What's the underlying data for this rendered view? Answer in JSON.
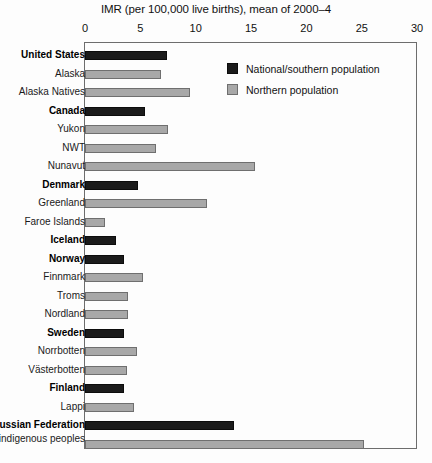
{
  "chart_data": {
    "type": "bar",
    "orientation": "horizontal",
    "title": "IMR (per 100,000 live births), mean of 2000–4",
    "xlabel": "",
    "ylabel": "",
    "xlim": [
      0,
      30
    ],
    "xticks": [
      "0",
      "5",
      "10",
      "15",
      "20",
      "25",
      "30"
    ],
    "grid": false,
    "legend_position": "top-right",
    "legend": [
      {
        "key": "national",
        "label": "National/southern population",
        "color": "#1b1b1b"
      },
      {
        "key": "northern",
        "label": "Northern population",
        "color": "#a8a8a8"
      }
    ],
    "categories": [
      "United States",
      "Alaska",
      "Alaska Natives",
      "Canada",
      "Yukon",
      "NWT",
      "Nunavut",
      "Denmark",
      "Greenland",
      "Faroe Islands",
      "Iceland",
      "Norway",
      "Finnmark",
      "Troms",
      "Nordland",
      "Sweden",
      "Norrbotten",
      "Västerbotten",
      "Finland",
      "Lappi",
      "Russian Federation",
      "Northern indigenous peoples"
    ],
    "values": [
      7.4,
      6.9,
      9.5,
      5.4,
      7.5,
      6.4,
      15.4,
      4.8,
      11.0,
      1.8,
      2.8,
      3.5,
      5.2,
      3.9,
      3.9,
      3.5,
      4.7,
      3.8,
      3.5,
      4.4,
      13.5,
      25.2
    ],
    "series_of": [
      "national",
      "northern",
      "northern",
      "national",
      "northern",
      "northern",
      "northern",
      "national",
      "northern",
      "northern",
      "national",
      "national",
      "northern",
      "northern",
      "northern",
      "national",
      "northern",
      "northern",
      "national",
      "northern",
      "national",
      "northern"
    ],
    "bold_labels": [
      "United States",
      "Canada",
      "Denmark",
      "Iceland",
      "Norway",
      "Sweden",
      "Finland",
      "Russian Federation"
    ],
    "rows": [
      {
        "label": "United States",
        "value": 7.4,
        "series": "national",
        "bold": true
      },
      {
        "label": "Alaska",
        "value": 6.9,
        "series": "northern",
        "bold": false
      },
      {
        "label": "Alaska Natives",
        "value": 9.5,
        "series": "northern",
        "bold": false
      },
      {
        "label": "Canada",
        "value": 5.4,
        "series": "national",
        "bold": true
      },
      {
        "label": "Yukon",
        "value": 7.5,
        "series": "northern",
        "bold": false
      },
      {
        "label": "NWT",
        "value": 6.4,
        "series": "northern",
        "bold": false
      },
      {
        "label": "Nunavut",
        "value": 15.4,
        "series": "northern",
        "bold": false
      },
      {
        "label": "Denmark",
        "value": 4.8,
        "series": "national",
        "bold": true
      },
      {
        "label": "Greenland",
        "value": 11.0,
        "series": "northern",
        "bold": false
      },
      {
        "label": "Faroe Islands",
        "value": 1.8,
        "series": "northern",
        "bold": false
      },
      {
        "label": "Iceland",
        "value": 2.8,
        "series": "national",
        "bold": true
      },
      {
        "label": "Norway",
        "value": 3.5,
        "series": "national",
        "bold": true
      },
      {
        "label": "Finnmark",
        "value": 5.2,
        "series": "northern",
        "bold": false
      },
      {
        "label": "Troms",
        "value": 3.9,
        "series": "northern",
        "bold": false
      },
      {
        "label": "Nordland",
        "value": 3.9,
        "series": "northern",
        "bold": false
      },
      {
        "label": "Sweden",
        "value": 3.5,
        "series": "national",
        "bold": true
      },
      {
        "label": "Norrbotten",
        "value": 4.7,
        "series": "northern",
        "bold": false
      },
      {
        "label": "Västerbotten",
        "value": 3.8,
        "series": "northern",
        "bold": false
      },
      {
        "label": "Finland",
        "value": 3.5,
        "series": "national",
        "bold": true
      },
      {
        "label": "Lappi",
        "value": 4.4,
        "series": "northern",
        "bold": false
      },
      {
        "label": "Russian Federation",
        "value": 13.5,
        "series": "national",
        "bold": true
      },
      {
        "label": "Northern indigenous peoples",
        "value": 25.2,
        "series": "northern",
        "bold": false
      }
    ]
  },
  "colors": {
    "national": "#1b1b1b",
    "northern": "#a8a8a8",
    "frame": "#6d6d6d",
    "background": "#fdfdfd"
  }
}
